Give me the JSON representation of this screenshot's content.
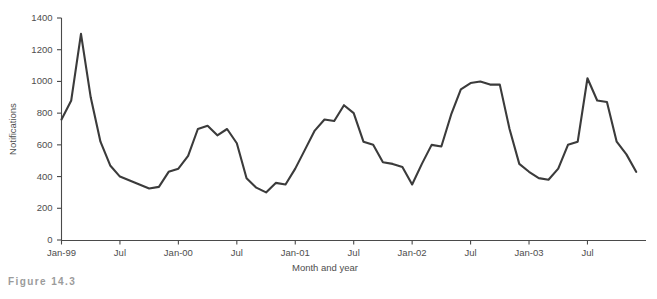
{
  "figure": {
    "caption": "Figure 14.3"
  },
  "chart_data": {
    "type": "line",
    "title": "",
    "xlabel": "Month and year",
    "ylabel": "Notifications",
    "ylim": [
      0,
      1400
    ],
    "yticks": [
      0,
      200,
      400,
      600,
      800,
      1000,
      1200,
      1400
    ],
    "ytick_labels": [
      "0",
      "200",
      "400",
      "600",
      "800",
      "1000",
      "1200",
      "1400"
    ],
    "xtick_labels": [
      "Jan-99",
      "Jul",
      "Jan-00",
      "Jul",
      "Jan-01",
      "Jul",
      "Jan-02",
      "Jul",
      "Jan-03",
      "Jul"
    ],
    "xtick_months": [
      "Jan-99",
      "Jul-99",
      "Jan-00",
      "Jul-00",
      "Jan-01",
      "Jul-01",
      "Jan-02",
      "Jul-02",
      "Jan-03",
      "Jul-03"
    ],
    "grid": false,
    "legend": "none",
    "line_color": "#3b3b3b",
    "axis_color": "#4a4a4a",
    "categories": [
      "Jan-99",
      "Feb-99",
      "Mar-99",
      "Apr-99",
      "May-99",
      "Jun-99",
      "Jul-99",
      "Aug-99",
      "Sep-99",
      "Oct-99",
      "Nov-99",
      "Dec-99",
      "Jan-00",
      "Feb-00",
      "Mar-00",
      "Apr-00",
      "May-00",
      "Jun-00",
      "Jul-00",
      "Aug-00",
      "Sep-00",
      "Oct-00",
      "Nov-00",
      "Dec-00",
      "Jan-01",
      "Feb-01",
      "Mar-01",
      "Apr-01",
      "May-01",
      "Jun-01",
      "Jul-01",
      "Aug-01",
      "Sep-01",
      "Oct-01",
      "Nov-01",
      "Dec-01",
      "Jan-02",
      "Feb-02",
      "Mar-02",
      "Apr-02",
      "May-02",
      "Jun-02",
      "Jul-02",
      "Aug-02",
      "Sep-02",
      "Oct-02",
      "Nov-02",
      "Dec-02",
      "Jan-03",
      "Feb-03",
      "Mar-03",
      "Apr-03",
      "May-03",
      "Jun-03",
      "Jul-03",
      "Aug-03",
      "Sep-03",
      "Oct-03",
      "Nov-03",
      "Dec-03"
    ],
    "values": [
      760,
      880,
      1300,
      900,
      620,
      470,
      400,
      375,
      350,
      325,
      335,
      430,
      450,
      530,
      700,
      720,
      660,
      700,
      610,
      390,
      330,
      300,
      360,
      350,
      450,
      570,
      690,
      760,
      750,
      850,
      800,
      620,
      600,
      490,
      480,
      460,
      350,
      480,
      600,
      590,
      790,
      950,
      990,
      1000,
      980,
      980,
      700,
      480,
      430,
      390,
      380,
      450,
      600,
      620,
      1020,
      880,
      870,
      620,
      540,
      430
    ],
    "series_name": "Notifications"
  }
}
